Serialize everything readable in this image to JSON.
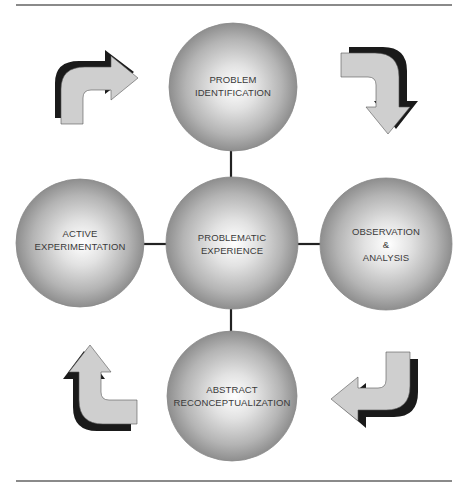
{
  "diagram": {
    "type": "cycle",
    "center": {
      "label": "PROBLEMATIC\nEXPERIENCE",
      "cx": 232,
      "cy": 243,
      "r": 66
    },
    "nodes": [
      {
        "id": "top",
        "label": "PROBLEM\nIDENTIFICATION",
        "cx": 233,
        "cy": 87,
        "r": 64
      },
      {
        "id": "right",
        "label": "OBSERVATION\n&\nANALYSIS",
        "cx": 386,
        "cy": 244,
        "r": 66
      },
      {
        "id": "bottom",
        "label": "ABSTRACT\nRECONCEPTUALIZATION",
        "cx": 232,
        "cy": 396,
        "r": 65
      },
      {
        "id": "left",
        "label": "ACTIVE\nEXPERIMENTATION",
        "cx": 80,
        "cy": 243,
        "r": 64
      }
    ],
    "arrows": [
      {
        "id": "arrow-top-left",
        "direction": "curved-right",
        "from": "ACTIVE EXPERIMENTATION",
        "to": "PROBLEM IDENTIFICATION"
      },
      {
        "id": "arrow-top-right",
        "direction": "curved-down",
        "from": "PROBLEM IDENTIFICATION",
        "to": "OBSERVATION & ANALYSIS"
      },
      {
        "id": "arrow-bottom-right",
        "direction": "curved-left",
        "from": "OBSERVATION & ANALYSIS",
        "to": "ABSTRACT RECONCEPTUALIZATION"
      },
      {
        "id": "arrow-bottom-left",
        "direction": "curved-up",
        "from": "ABSTRACT RECONCEPTUALIZATION",
        "to": "ACTIVE EXPERIMENTATION"
      }
    ],
    "colors": {
      "sphere_highlight": "#ffffff",
      "sphere_mid": "#c4c4c4",
      "sphere_edge": "#8e8e8e",
      "arrow_fill": "#cfcfcf",
      "arrow_shadow": "#1a1a1a",
      "connector": "#222222",
      "rule": "#8a8a8a",
      "text": "#3a3a3a"
    }
  }
}
